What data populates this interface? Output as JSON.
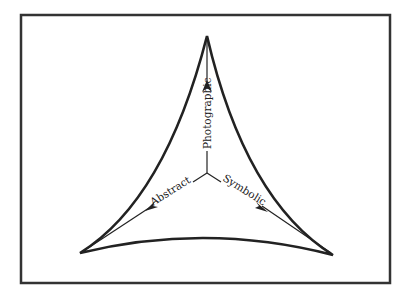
{
  "diagram": {
    "type": "triangle-space",
    "frame": {
      "stroke": "#333333"
    },
    "colors": {
      "stroke": "#222222",
      "background": "#ffffff"
    },
    "axes": [
      {
        "label": "Photographic",
        "direction": "up"
      },
      {
        "label": "Abstract",
        "direction": "lower-left"
      },
      {
        "label": "Symbolic",
        "direction": "lower-right"
      }
    ]
  }
}
